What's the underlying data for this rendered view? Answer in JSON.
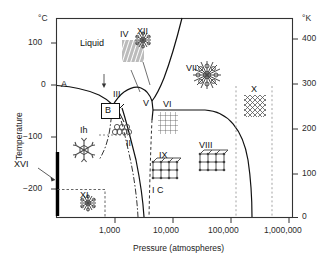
{
  "figure": {
    "kind": "phase-diagram",
    "axes": {
      "x": {
        "title": "Pressure (atmospheres)",
        "scale": "log",
        "ticklabels": [
          "1,000",
          "10,000",
          "100,000",
          "1,000,000"
        ],
        "tickvalues": [
          1000,
          10000,
          100000,
          1000000
        ]
      },
      "y_left": {
        "title": "Temperature",
        "unit": "°C",
        "ticklabels": [
          "100",
          "0",
          "−100",
          "−200"
        ],
        "tickvalues": [
          100,
          0,
          -100,
          -200
        ]
      },
      "y_right": {
        "unit": "°K",
        "ticklabels": [
          "400",
          "300",
          "200",
          "100",
          "0"
        ],
        "tickvalues": [
          400,
          300,
          200,
          100,
          0
        ]
      }
    },
    "regions": [
      {
        "id": "liquid",
        "label": "Liquid"
      },
      {
        "id": "ih",
        "label": "Ih"
      },
      {
        "id": "ic",
        "label": "I C"
      },
      {
        "id": "ii",
        "label": "II"
      },
      {
        "id": "iii",
        "label": "III"
      },
      {
        "id": "iv",
        "label": "IV"
      },
      {
        "id": "v",
        "label": "V"
      },
      {
        "id": "vi",
        "label": "VI"
      },
      {
        "id": "vii",
        "label": "VII"
      },
      {
        "id": "viii",
        "label": "VIII"
      },
      {
        "id": "ix",
        "label": "IX"
      },
      {
        "id": "x",
        "label": "X"
      },
      {
        "id": "xi",
        "label": "XI"
      },
      {
        "id": "xii",
        "label": "XII"
      },
      {
        "id": "xvi",
        "label": "XVI"
      },
      {
        "id": "a",
        "label": "A"
      },
      {
        "id": "b",
        "label": "B"
      }
    ],
    "colors": {
      "line": "#111111",
      "frame": "#333333",
      "dashed": "#555555",
      "crystal": "#4a4a4a",
      "background": "#ffffff"
    }
  }
}
